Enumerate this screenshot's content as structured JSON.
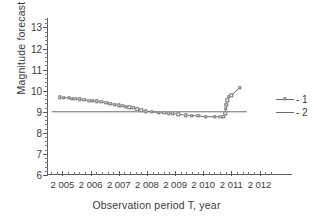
{
  "chart_data": {
    "type": "line",
    "title": "",
    "xlabel": "Observation period T, year",
    "ylabel": "Magnitude forecast  M",
    "xlim": [
      2004.45,
      2012.55
    ],
    "ylim": [
      6,
      13.45
    ],
    "grid": false,
    "legend_position": "right",
    "xticks": [
      2005,
      2006,
      2007,
      2008,
      2009,
      2010,
      2011,
      2012
    ],
    "xticklabels": [
      "2 005",
      "2 006",
      "2 007",
      "2 008",
      "2 009",
      "2 010",
      "2 011",
      "2 012"
    ],
    "x_minor_interval": 0.2,
    "yticks": [
      6,
      7,
      8,
      9,
      10,
      11,
      12,
      13
    ],
    "yticklabels": [
      "6",
      "7",
      "8",
      "9",
      "10",
      "11",
      "12",
      "13"
    ],
    "y_minor_interval": 0.2,
    "series": [
      {
        "name": "1",
        "legend_label": "- 1",
        "style": "line-with-open-square-markers",
        "color": "#6d6d6d",
        "x": [
          2004.9,
          2005.05,
          2005.22,
          2005.33,
          2005.45,
          2005.62,
          2005.78,
          2005.95,
          2006.08,
          2006.22,
          2006.38,
          2006.55,
          2006.7,
          2006.85,
          2007.0,
          2007.12,
          2007.25,
          2007.38,
          2007.52,
          2007.66,
          2007.8,
          2007.95,
          2008.18,
          2008.42,
          2008.62,
          2008.78,
          2008.92,
          2009.12,
          2009.38,
          2009.6,
          2009.82,
          2010.1,
          2010.42,
          2010.6,
          2010.72,
          2010.78,
          2010.8,
          2010.82,
          2010.85,
          2010.9,
          2011.0,
          2011.3
        ],
        "y": [
          9.68,
          9.67,
          9.65,
          9.63,
          9.62,
          9.6,
          9.56,
          9.53,
          9.52,
          9.5,
          9.47,
          9.42,
          9.38,
          9.34,
          9.3,
          9.27,
          9.24,
          9.21,
          9.18,
          9.12,
          9.07,
          9.02,
          9.0,
          8.96,
          8.94,
          8.93,
          8.92,
          8.88,
          8.84,
          8.82,
          8.8,
          8.77,
          8.76,
          8.76,
          8.76,
          8.92,
          9.14,
          9.34,
          9.54,
          9.72,
          9.78,
          10.15
        ]
      },
      {
        "name": "2",
        "legend_label": "- 2",
        "style": "solid-line",
        "color": "#6d6d6d",
        "constant_y": 9.0,
        "x": [
          2004.62,
          2011.55
        ],
        "y": [
          9.0,
          9.0
        ]
      }
    ]
  }
}
